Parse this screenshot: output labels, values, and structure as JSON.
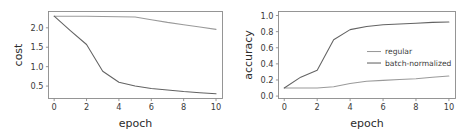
{
  "figure": {
    "background": "#ffffff",
    "axis_color": "#8a8a8a",
    "text_color": "#3a3a3a"
  },
  "chart_data": [
    {
      "type": "line",
      "id": "cost-plot",
      "title": "",
      "xlabel": "epoch",
      "ylabel": "cost",
      "xlim": [
        -0.35,
        10.4
      ],
      "ylim": [
        0.18,
        2.42
      ],
      "xticks": [
        0,
        2,
        4,
        6,
        8,
        10
      ],
      "xticklabels": [
        "0",
        "2",
        "4",
        "6",
        "8",
        "10"
      ],
      "yticks": [
        0.5,
        1.0,
        1.5,
        2.0
      ],
      "yticklabels": [
        "0.5",
        "1.0",
        "1.5",
        "2.0"
      ],
      "grid": false,
      "legend": null,
      "x": [
        0,
        1,
        2,
        3,
        4,
        5,
        6,
        7,
        8,
        9,
        10
      ],
      "series": [
        {
          "name": "regular",
          "color": "#9a9a9a",
          "values": [
            2.3,
            2.3,
            2.295,
            2.29,
            2.285,
            2.28,
            2.21,
            2.14,
            2.08,
            2.02,
            1.96
          ]
        },
        {
          "name": "batch-normalized",
          "color": "#636363",
          "values": [
            2.3,
            1.93,
            1.57,
            0.88,
            0.6,
            0.5,
            0.44,
            0.4,
            0.36,
            0.33,
            0.3
          ]
        }
      ]
    },
    {
      "type": "line",
      "id": "accuracy-plot",
      "title": "",
      "xlabel": "epoch",
      "ylabel": "accuracy",
      "xlim": [
        -0.35,
        10.4
      ],
      "ylim": [
        -0.03,
        1.05
      ],
      "xticks": [
        0,
        2,
        4,
        6,
        8,
        10
      ],
      "xticklabels": [
        "0",
        "2",
        "4",
        "6",
        "8",
        "10"
      ],
      "yticks": [
        0.0,
        0.2,
        0.4,
        0.6,
        0.8,
        1.0
      ],
      "yticklabels": [
        "0.0",
        "0.2",
        "0.4",
        "0.6",
        "0.8",
        "1.0"
      ],
      "grid": false,
      "legend": {
        "position": "center-right",
        "entries": [
          {
            "label": "regular",
            "color": "#9a9a9a"
          },
          {
            "label": "batch-normalized",
            "color": "#636363"
          }
        ]
      },
      "x": [
        0,
        1,
        2,
        3,
        4,
        5,
        6,
        7,
        8,
        9,
        10
      ],
      "series": [
        {
          "name": "regular",
          "color": "#9a9a9a",
          "values": [
            0.1,
            0.1,
            0.1,
            0.115,
            0.155,
            0.185,
            0.195,
            0.205,
            0.215,
            0.235,
            0.25
          ]
        },
        {
          "name": "batch-normalized",
          "color": "#636363",
          "values": [
            0.1,
            0.235,
            0.32,
            0.7,
            0.825,
            0.865,
            0.885,
            0.895,
            0.905,
            0.915,
            0.92
          ]
        }
      ]
    }
  ]
}
